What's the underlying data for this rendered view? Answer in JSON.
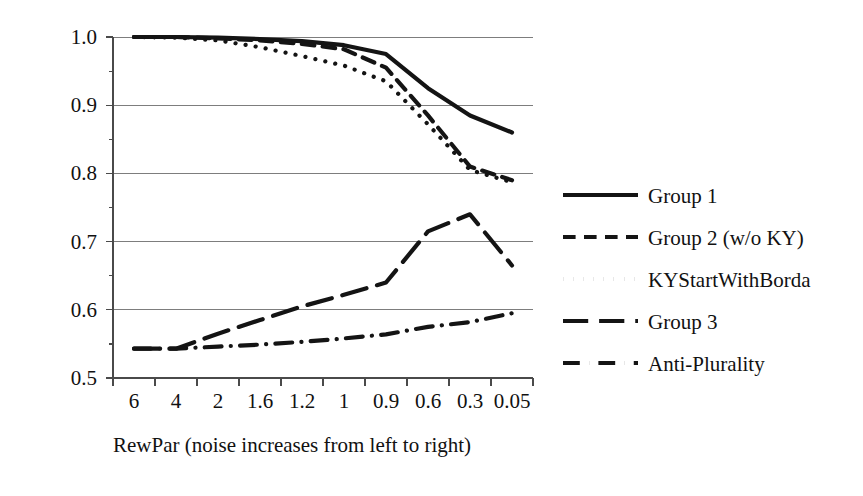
{
  "chart_data": {
    "type": "line",
    "title": "",
    "xlabel": "RewPar (noise increases from left to right)",
    "ylabel": "",
    "categories": [
      "6",
      "4",
      "2",
      "1.6",
      "1.2",
      "1",
      "0.9",
      "0.6",
      "0.3",
      "0.05"
    ],
    "ylim": [
      0.5,
      1.0
    ],
    "yticks": [
      "0.5",
      "0.6",
      "0.7",
      "0.8",
      "0.9",
      "1.0"
    ],
    "grid": true,
    "legend_position": "right",
    "series": [
      {
        "name": "Group 1",
        "style": "solid",
        "values": [
          1.0,
          1.0,
          0.999,
          0.997,
          0.994,
          0.988,
          0.975,
          0.925,
          0.885,
          0.86
        ]
      },
      {
        "name": "Group 2 (w/o KY)",
        "style": "dashed",
        "values": [
          1.0,
          1.0,
          0.998,
          0.995,
          0.99,
          0.982,
          0.955,
          0.885,
          0.81,
          0.79
        ]
      },
      {
        "name": "KYStartWithBorda",
        "style": "dotted",
        "values": [
          1.0,
          0.999,
          0.995,
          0.985,
          0.972,
          0.958,
          0.935,
          0.872,
          0.805,
          0.787
        ]
      },
      {
        "name": "Group 3",
        "style": "long-dash",
        "values": [
          0.543,
          0.543,
          0.565,
          0.585,
          0.605,
          0.622,
          0.64,
          0.715,
          0.74,
          0.665
        ]
      },
      {
        "name": "Anti-Plurality",
        "style": "dash-dot",
        "values": [
          0.543,
          0.543,
          0.546,
          0.549,
          0.553,
          0.558,
          0.564,
          0.575,
          0.582,
          0.595
        ]
      }
    ]
  },
  "axes": {
    "y_tick_labels": [
      "1.0",
      "0.9",
      "0.8",
      "0.7",
      "0.6",
      "0.5"
    ],
    "x_tick_labels": [
      "6",
      "4",
      "2",
      "1.6",
      "1.2",
      "1",
      "0.9",
      "0.6",
      "0.3",
      "0.05"
    ],
    "x_axis_title": "RewPar (noise increases from left to right)"
  },
  "legend": {
    "items": [
      {
        "label": "Group 1",
        "style": "solid"
      },
      {
        "label": "Group 2 (w/o KY)",
        "style": "dashed"
      },
      {
        "label": "KYStartWithBorda",
        "style": "dotted"
      },
      {
        "label": "Group 3",
        "style": "long-dash"
      },
      {
        "label": "Anti-Plurality",
        "style": "dash-dot"
      }
    ]
  },
  "colors": {
    "ink": "#141414",
    "grid": "#7d7d7d",
    "axis": "#4a4a4a",
    "background": "#ffffff"
  }
}
